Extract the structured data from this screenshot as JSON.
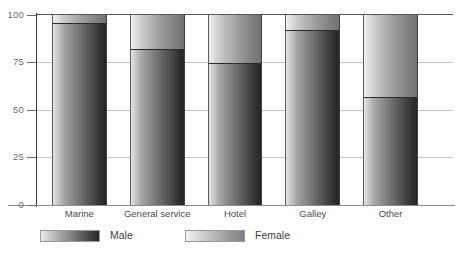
{
  "chart_data": {
    "type": "bar",
    "subtype": "stacked-percentage",
    "title": "",
    "xlabel": "",
    "ylabel": "",
    "categories": [
      "Marine",
      "General service",
      "Hotel",
      "Galley",
      "Other"
    ],
    "series": [
      {
        "name": "Male",
        "values": [
          96,
          82,
          75,
          92,
          57
        ]
      },
      {
        "name": "Female",
        "values": [
          4,
          18,
          25,
          8,
          43
        ]
      }
    ],
    "ylim": [
      0,
      100
    ],
    "yticks": [
      0,
      25,
      50,
      75,
      100
    ],
    "ytick_labels": [
      "0",
      "25",
      "50",
      "75",
      "100"
    ],
    "grid": true,
    "legend_position": "bottom",
    "colors": {
      "male_light": "#efefef",
      "male_dark": "#242424",
      "female_light": "#f6f6f6",
      "female_dark": "#6f6f6f",
      "axis": "#6d6d6d",
      "gridline": "#b9b9b9"
    }
  },
  "axis": {
    "ticks": [
      {
        "label": "100",
        "value": 100
      },
      {
        "label": "75",
        "value": 75
      },
      {
        "label": "50",
        "value": 50
      },
      {
        "label": "25",
        "value": 25
      },
      {
        "label": "0",
        "value": 0
      }
    ]
  },
  "legend": {
    "items": [
      {
        "label": "Male"
      },
      {
        "label": "Female"
      }
    ]
  }
}
